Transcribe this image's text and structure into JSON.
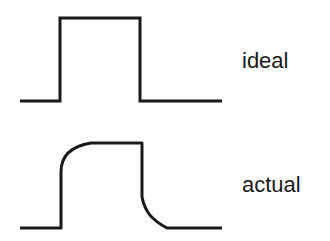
{
  "diagram": {
    "type": "pulse-waveform-comparison",
    "stroke_color": "#1a1a1a",
    "background": "#ffffff",
    "waveforms": [
      {
        "name": "ideal",
        "label": "ideal",
        "shape": "square pulse with vertical rise and fall"
      },
      {
        "name": "actual",
        "label": "actual",
        "shape": "pulse with rounded rise and rounded fall"
      }
    ]
  }
}
